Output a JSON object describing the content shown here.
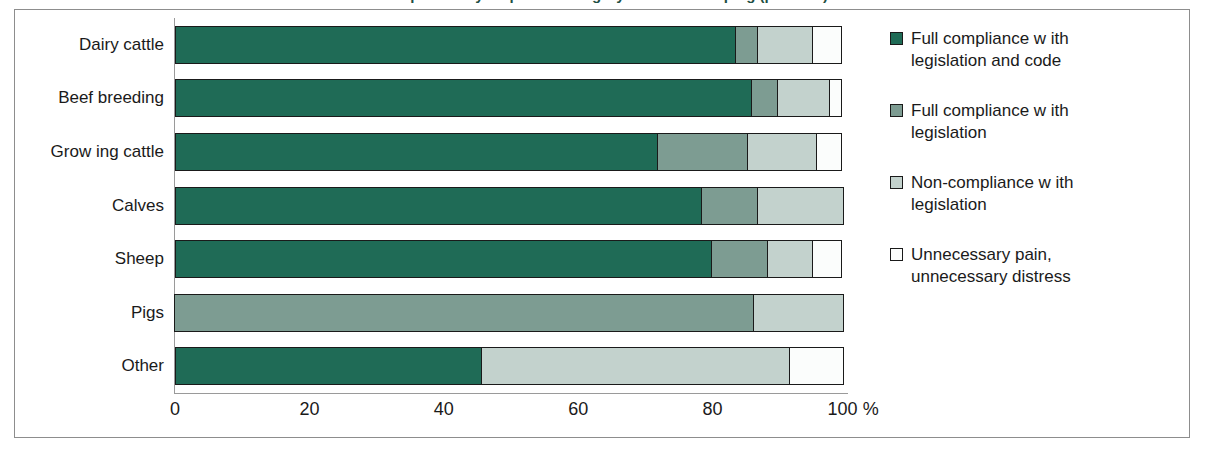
{
  "figure": {
    "title": "Compliance by inspected category of animal keeping (per cent)",
    "frame_color": "#8d8d8d"
  },
  "chart_data": {
    "type": "bar",
    "orientation": "horizontal",
    "stacked": true,
    "stack_mode": "percent",
    "title": "Compliance by inspected category of animal keeping (per cent)",
    "xlabel": "",
    "ylabel": "",
    "xlim": [
      0,
      100
    ],
    "grid": false,
    "legend_position": "right",
    "categories": [
      "Dairy cattle",
      "Beef breeding",
      "Grow ing cattle",
      "Calves",
      "Sheep",
      "Pigs",
      "Other"
    ],
    "series": [
      {
        "name": "Full compliance w ith legislation and code",
        "color": "#1f6b56",
        "values": [
          83.5,
          86.0,
          72.0,
          78.5,
          80.0,
          0.0,
          45.8
        ]
      },
      {
        "name": "Full compliance w ith legislation",
        "color": "#7d9c92",
        "values": [
          3.5,
          4.0,
          13.5,
          8.5,
          8.5,
          86.5,
          0.0
        ]
      },
      {
        "name": "Non-compliance w ith legislation",
        "color": "#c3d2cd",
        "values": [
          8.5,
          8.0,
          10.5,
          13.0,
          7.0,
          13.5,
          46.0
        ]
      },
      {
        "name": "Unnecessary pain, unnecessary distress",
        "color": "#fbfdfc",
        "values": [
          4.5,
          2.0,
          4.0,
          0.0,
          4.5,
          0.0,
          8.2
        ]
      }
    ],
    "xticks": [
      {
        "value": 0,
        "label": "0"
      },
      {
        "value": 20,
        "label": "20"
      },
      {
        "value": 40,
        "label": "40"
      },
      {
        "value": 60,
        "label": "60"
      },
      {
        "value": 80,
        "label": "80"
      },
      {
        "value": 100,
        "label": "100 %"
      }
    ]
  }
}
